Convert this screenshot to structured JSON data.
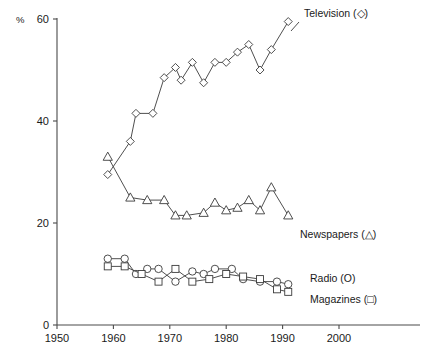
{
  "chart_title_partial": "",
  "axes": {
    "y_unit_label": "%",
    "y_ticks": [
      0,
      20,
      40,
      60
    ],
    "x_ticks": [
      1950,
      1960,
      1970,
      1980,
      1990,
      2000
    ],
    "xlim": [
      1950,
      2005
    ],
    "ylim": [
      0,
      60
    ],
    "grid": false
  },
  "labels": {
    "television": "Television (◇)",
    "newspapers": "Newspapers (△)",
    "radio": "Radio (O)",
    "magazines": "Magazines (□)"
  },
  "chart_data": {
    "type": "line",
    "title": "",
    "subtitle": "",
    "xlabel": "",
    "ylabel": "%",
    "xlim": [
      1950,
      2005
    ],
    "ylim": [
      0,
      60
    ],
    "grid": false,
    "legend_position": "inline-right",
    "x_ticks": [
      1950,
      1960,
      1970,
      1980,
      1990,
      2000
    ],
    "y_ticks": [
      0,
      20,
      40,
      60
    ],
    "series": [
      {
        "name": "Television",
        "marker": "diamond",
        "points": [
          [
            1959,
            29.5
          ],
          [
            1963,
            36.0
          ],
          [
            1964,
            41.5
          ],
          [
            1967,
            41.5
          ],
          [
            1969,
            48.5
          ],
          [
            1971,
            50.5
          ],
          [
            1972,
            48.0
          ],
          [
            1974,
            51.5
          ],
          [
            1976,
            47.5
          ],
          [
            1978,
            51.5
          ],
          [
            1980,
            51.5
          ],
          [
            1982,
            53.5
          ],
          [
            1984,
            55.0
          ],
          [
            1986,
            50.0
          ],
          [
            1988,
            54.0
          ],
          [
            1991,
            59.5
          ]
        ]
      },
      {
        "name": "Newspapers",
        "marker": "triangle",
        "points": [
          [
            1959,
            33.0
          ],
          [
            1963,
            25.0
          ],
          [
            1966,
            24.5
          ],
          [
            1969,
            24.5
          ],
          [
            1971,
            21.5
          ],
          [
            1973,
            21.5
          ],
          [
            1976,
            22.0
          ],
          [
            1978,
            24.0
          ],
          [
            1980,
            22.5
          ],
          [
            1982,
            23.0
          ],
          [
            1984,
            24.5
          ],
          [
            1986,
            22.5
          ],
          [
            1988,
            27.0
          ],
          [
            1991,
            21.5
          ]
        ]
      },
      {
        "name": "Radio",
        "marker": "circle",
        "points": [
          [
            1959,
            13.0
          ],
          [
            1962,
            13.0
          ],
          [
            1964,
            10.0
          ],
          [
            1966,
            11.0
          ],
          [
            1968,
            11.0
          ],
          [
            1971,
            8.5
          ],
          [
            1974,
            10.5
          ],
          [
            1976,
            10.0
          ],
          [
            1978,
            11.0
          ],
          [
            1981,
            11.0
          ],
          [
            1983,
            9.0
          ],
          [
            1986,
            8.5
          ],
          [
            1989,
            8.5
          ],
          [
            1991,
            8.0
          ]
        ]
      },
      {
        "name": "Magazines",
        "marker": "square",
        "points": [
          [
            1959,
            11.5
          ],
          [
            1962,
            11.5
          ],
          [
            1965,
            10.0
          ],
          [
            1968,
            8.5
          ],
          [
            1971,
            11.0
          ],
          [
            1974,
            8.5
          ],
          [
            1977,
            9.0
          ],
          [
            1980,
            10.0
          ],
          [
            1983,
            9.5
          ],
          [
            1986,
            9.0
          ],
          [
            1989,
            7.0
          ],
          [
            1991,
            6.5
          ]
        ]
      }
    ]
  }
}
